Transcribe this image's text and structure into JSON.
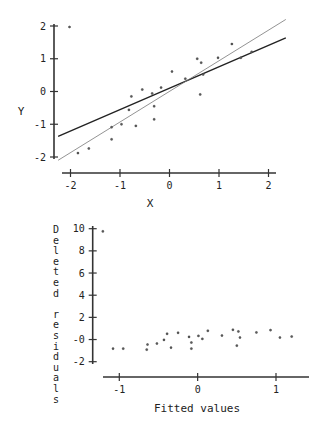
{
  "chart_data": [
    {
      "type": "scatter",
      "title": "",
      "xlabel": "X",
      "ylabel": "Y",
      "xlim": [
        -2.3,
        2.4
      ],
      "ylim": [
        -2.1,
        2.2
      ],
      "xticks": [
        -2,
        -1,
        0,
        1,
        2
      ],
      "xtick_labels": [
        "-2",
        "-1",
        "0",
        "1",
        "2"
      ],
      "yticks": [
        -2,
        -1,
        0,
        1,
        2
      ],
      "ytick_labels": [
        "-2",
        "-1",
        "0",
        "1",
        "2"
      ],
      "grid": false,
      "points": [
        {
          "x": -2.02,
          "y": 1.97
        },
        {
          "x": -1.85,
          "y": -1.88
        },
        {
          "x": -1.63,
          "y": -1.74
        },
        {
          "x": -1.17,
          "y": -1.09
        },
        {
          "x": -1.17,
          "y": -1.46
        },
        {
          "x": -0.97,
          "y": -1.0
        },
        {
          "x": -0.82,
          "y": -0.56
        },
        {
          "x": -0.77,
          "y": -0.15
        },
        {
          "x": -0.68,
          "y": -1.05
        },
        {
          "x": -0.55,
          "y": 0.06
        },
        {
          "x": -0.35,
          "y": -0.06
        },
        {
          "x": -0.31,
          "y": -0.45
        },
        {
          "x": -0.31,
          "y": -0.85
        },
        {
          "x": -0.17,
          "y": 0.12
        },
        {
          "x": 0.05,
          "y": 0.61
        },
        {
          "x": 0.32,
          "y": 0.39
        },
        {
          "x": 0.56,
          "y": 1.0
        },
        {
          "x": 0.64,
          "y": 0.88
        },
        {
          "x": 0.62,
          "y": -0.09
        },
        {
          "x": 0.68,
          "y": 0.52
        },
        {
          "x": 0.98,
          "y": 1.03
        },
        {
          "x": 1.26,
          "y": 1.45
        },
        {
          "x": 1.44,
          "y": 1.03
        },
        {
          "x": 1.66,
          "y": 1.21
        }
      ],
      "lines": [
        {
          "name": "fit-with-outlier",
          "style": "bold",
          "x": [
            -2.25,
            2.35
          ],
          "y": [
            -1.37,
            1.64
          ]
        },
        {
          "name": "fit-without-outlier",
          "style": "thin",
          "x": [
            -2.25,
            2.35
          ],
          "y": [
            -2.1,
            2.2
          ]
        }
      ],
      "layout": {
        "x_px": [
          70.5,
          268.5
        ],
        "x_vals": [
          -2,
          2
        ],
        "y_px": [
          26,
          157
        ],
        "y_vals": [
          2,
          -2
        ],
        "y_axis_x": 54,
        "y_axis_top": 24,
        "y_axis_bottom": 159,
        "x_axis_y": 173,
        "x_axis_left": 62,
        "x_axis_right": 276,
        "xlabel_pos": [
          150,
          207
        ],
        "ylabel_pos": [
          21,
          115
        ]
      }
    },
    {
      "type": "scatter",
      "title": "",
      "xlabel": "Fitted values",
      "ylabel": "Deleted residuals",
      "xlim": [
        -1.3,
        1.45
      ],
      "ylim": [
        -2.5,
        10.5
      ],
      "xticks": [
        -1,
        0,
        1
      ],
      "xtick_labels": [
        "-1",
        "0",
        "1"
      ],
      "yticks": [
        10,
        8,
        6,
        4,
        2,
        0,
        -2
      ],
      "ytick_labels": [
        "10",
        "8",
        "6",
        "4",
        "2",
        "-0",
        "-2"
      ],
      "grid": false,
      "points": [
        {
          "x": -1.21,
          "y": 9.76
        },
        {
          "x": -1.08,
          "y": -0.82
        },
        {
          "x": -0.95,
          "y": -0.82
        },
        {
          "x": -0.65,
          "y": -0.91
        },
        {
          "x": -0.64,
          "y": -0.45
        },
        {
          "x": -0.52,
          "y": -0.36
        },
        {
          "x": -0.43,
          "y": -0.03
        },
        {
          "x": -0.39,
          "y": 0.52
        },
        {
          "x": -0.34,
          "y": -0.73
        },
        {
          "x": -0.25,
          "y": 0.61
        },
        {
          "x": -0.11,
          "y": 0.24
        },
        {
          "x": -0.08,
          "y": -0.27
        },
        {
          "x": -0.08,
          "y": -0.82
        },
        {
          "x": 0.01,
          "y": 0.33
        },
        {
          "x": 0.06,
          "y": 0.06
        },
        {
          "x": 0.13,
          "y": 0.79
        },
        {
          "x": 0.31,
          "y": 0.36
        },
        {
          "x": 0.45,
          "y": 0.88
        },
        {
          "x": 0.52,
          "y": 0.73
        },
        {
          "x": 0.5,
          "y": -0.55
        },
        {
          "x": 0.54,
          "y": 0.18
        },
        {
          "x": 0.75,
          "y": 0.64
        },
        {
          "x": 0.93,
          "y": 0.85
        },
        {
          "x": 1.05,
          "y": 0.18
        },
        {
          "x": 1.2,
          "y": 0.27
        }
      ],
      "lines": [],
      "layout": {
        "x_px": [
          119.3,
          276
        ],
        "x_vals": [
          -1,
          1
        ],
        "y_px": [
          228.7,
          361.7
        ],
        "y_vals": [
          10,
          -2
        ],
        "y_axis_x": 92.7,
        "y_axis_top": 226,
        "y_axis_bottom": 364,
        "x_axis_y": 377,
        "x_axis_left": 103,
        "x_axis_right": 309,
        "xlabel_pos": [
          197,
          412
        ],
        "vertical_label_x": 56,
        "vertical_label_top": 233,
        "vertical_label_step": 10.6
      }
    }
  ]
}
